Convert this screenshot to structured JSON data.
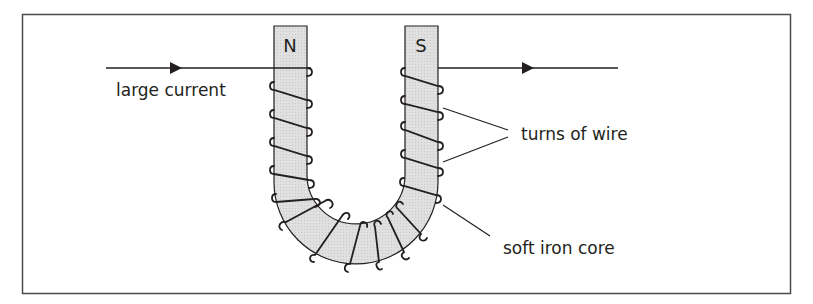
{
  "diagram": {
    "poles": {
      "left": "N",
      "right": "S"
    },
    "labels": {
      "current": "large current",
      "turns": "turns of wire",
      "core": "soft iron core"
    },
    "colors": {
      "frame": "#4a4a4a",
      "core_fill": "#dcdcdc",
      "line": "#231f20",
      "text": "#231f20"
    }
  }
}
